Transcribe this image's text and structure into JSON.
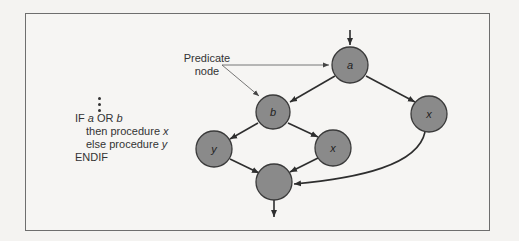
{
  "figure": {
    "code_snippet": {
      "continuation_dots": "⋮",
      "lines": [
        {
          "prefix": "IF ",
          "var1": "a",
          "op": " OR ",
          "var2": "b"
        },
        {
          "prefix": "then procedure ",
          "var": "x"
        },
        {
          "prefix": "else procedure ",
          "var": "y"
        },
        {
          "text": "ENDIF"
        }
      ]
    },
    "annotation": {
      "line1": "Predicate",
      "line2": "node"
    },
    "nodes": [
      {
        "id": "a",
        "label": "a",
        "predicate": true
      },
      {
        "id": "b",
        "label": "b",
        "predicate": true
      },
      {
        "id": "y",
        "label": "y"
      },
      {
        "id": "x1",
        "label": "x"
      },
      {
        "id": "x2",
        "label": "x"
      },
      {
        "id": "join",
        "label": ""
      }
    ],
    "edges": [
      {
        "from": "entry",
        "to": "a"
      },
      {
        "from": "a",
        "to": "b"
      },
      {
        "from": "a",
        "to": "x2"
      },
      {
        "from": "b",
        "to": "y"
      },
      {
        "from": "b",
        "to": "x1"
      },
      {
        "from": "y",
        "to": "join"
      },
      {
        "from": "x1",
        "to": "join"
      },
      {
        "from": "x2",
        "to": "join"
      },
      {
        "from": "join",
        "to": "exit"
      }
    ],
    "colors": {
      "node_fill": "#8a8a8a",
      "node_stroke": "#3a3a3a",
      "edge": "#2e2e2e",
      "frame": "#6e6e6e"
    }
  }
}
